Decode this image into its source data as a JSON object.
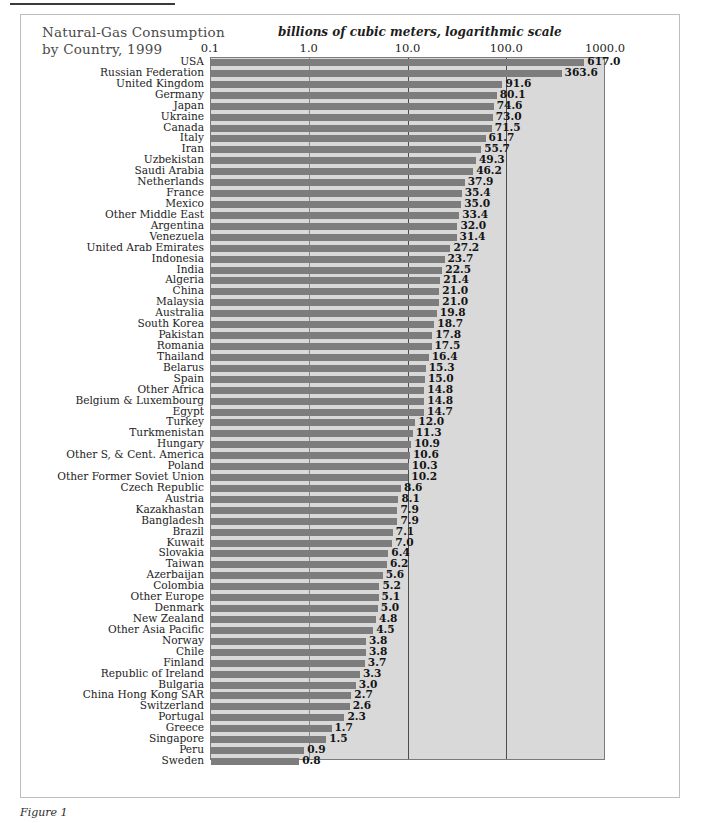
{
  "figure": {
    "title_line1": "Natural-Gas Consumption",
    "title_line2": "by Country, 1999",
    "caption": "Figure 1"
  },
  "chart_data": {
    "type": "bar",
    "orientation": "horizontal",
    "title": "Natural-Gas Consumption by Country, 1999",
    "xlabel": "billions of cubic meters, logarithmic scale",
    "ylabel": "",
    "scale": "log",
    "xlim": [
      0.1,
      1000.0
    ],
    "xticks": [
      0.1,
      1.0,
      10.0,
      100.0,
      1000.0
    ],
    "xticklabels": [
      "0.1",
      "1.0",
      "10.0",
      "100.0",
      "1000.0"
    ],
    "grid": true,
    "gridlines_at": [
      1.0,
      10.0,
      100.0
    ],
    "legend": null,
    "bar_color": "#7d7d7d",
    "plot_background": "#d9d9d9",
    "categories": [
      "USA",
      "Russian Federation",
      "United Kingdom",
      "Germany",
      "Japan",
      "Ukraine",
      "Canada",
      "Italy",
      "Iran",
      "Uzbekistan",
      "Saudi Arabia",
      "Netherlands",
      "France",
      "Mexico",
      "Other Middle East",
      "Argentina",
      "Venezuela",
      "United Arab Emirates",
      "Indonesia",
      "India",
      "Algeria",
      "China",
      "Malaysia",
      "Australia",
      "South Korea",
      "Pakistan",
      "Romania",
      "Thailand",
      "Belarus",
      "Spain",
      "Other Africa",
      "Belgium & Luxembourg",
      "Egypt",
      "Turkey",
      "Turkmenistan",
      "Hungary",
      "Other S, & Cent. America",
      "Poland",
      "Other Former Soviet Union",
      "Czech Republic",
      "Austria",
      "Kazakhastan",
      "Bangladesh",
      "Brazil",
      "Kuwait",
      "Slovakia",
      "Taiwan",
      "Azerbaijan",
      "Colombia",
      "Other Europe",
      "Denmark",
      "New Zealand",
      "Other Asia Pacific",
      "Norway",
      "Chile",
      "Finland",
      "Republic of Ireland",
      "Bulgaria",
      "China Hong Kong SAR",
      "Switzerland",
      "Portugal",
      "Greece",
      "Singapore",
      "Peru",
      "Sweden"
    ],
    "values": [
      617.0,
      363.6,
      91.6,
      80.1,
      74.6,
      73.0,
      71.5,
      61.7,
      55.7,
      49.3,
      46.2,
      37.9,
      35.4,
      35.0,
      33.4,
      32.0,
      31.4,
      27.2,
      23.7,
      22.5,
      21.4,
      21.0,
      21.0,
      19.8,
      18.7,
      17.8,
      17.5,
      16.4,
      15.3,
      15.0,
      14.8,
      14.8,
      14.7,
      12.0,
      11.3,
      10.9,
      10.6,
      10.3,
      10.2,
      8.6,
      8.1,
      7.9,
      7.9,
      7.1,
      7.0,
      6.4,
      6.2,
      5.6,
      5.2,
      5.1,
      5.0,
      4.8,
      4.5,
      3.8,
      3.8,
      3.7,
      3.3,
      3.0,
      2.7,
      2.6,
      2.3,
      1.7,
      1.5,
      0.9,
      0.8
    ],
    "value_labels": [
      "617.0",
      "363.6",
      "91.6",
      "80.1",
      "74.6",
      "73.0",
      "71.5",
      "61.7",
      "55.7",
      "49.3",
      "46.2",
      "37.9",
      "35.4",
      "35.0",
      "33.4",
      "32.0",
      "31.4",
      "27.2",
      "23.7",
      "22.5",
      "21.4",
      "21.0",
      "21.0",
      "19.8",
      "18.7",
      "17.8",
      "17.5",
      "16.4",
      "15.3",
      "15.0",
      "14.8",
      "14.8",
      "14.7",
      "12.0",
      "11.3",
      "10.9",
      "10.6",
      "10.3",
      "10.2",
      "8.6",
      "8.1",
      "7.9",
      "7.9",
      "7.1",
      "7.0",
      "6.4",
      "6.2",
      "5.6",
      "5.2",
      "5.1",
      "5.0",
      "4.8",
      "4.5",
      "3.8",
      "3.8",
      "3.7",
      "3.3",
      "3.0",
      "2.7",
      "2.6",
      "2.3",
      "1.7",
      "1.5",
      "0.9",
      "0.8"
    ]
  }
}
